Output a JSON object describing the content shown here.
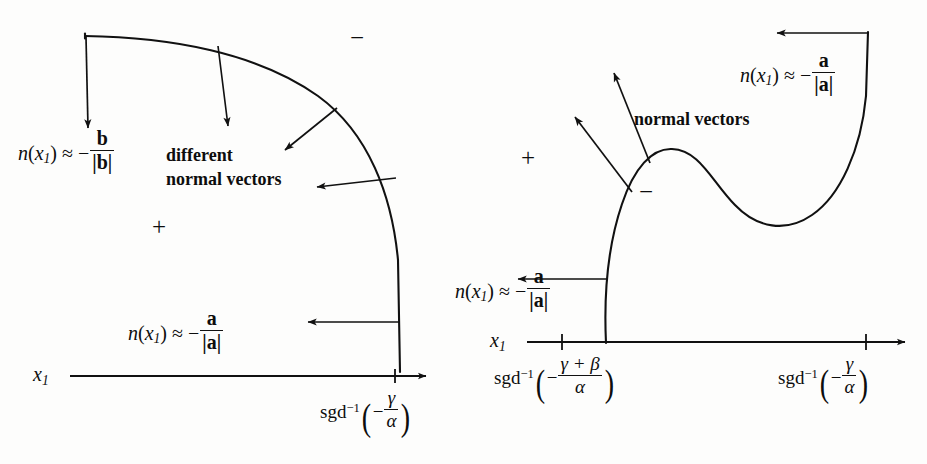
{
  "figure": {
    "background_color": "#fdfdfc",
    "ink_color": "#111111"
  },
  "left_panel": {
    "region_sign_outside": "−",
    "region_sign_inside": "+",
    "normal_label_top": {
      "n": "n",
      "arg_open": "(",
      "var": "x",
      "sub": "1",
      "arg_close": ")",
      "approx": "≈",
      "minus": "−",
      "numerator": "b",
      "denominator": "|b|"
    },
    "annotation_text_line1": "different",
    "annotation_text_line2": "normal vectors",
    "normal_label_bottom": {
      "n": "n",
      "arg_open": "(",
      "var": "x",
      "sub": "1",
      "arg_close": ")",
      "approx": "≈",
      "minus": "−",
      "numerator": "a",
      "denominator": "|a|"
    },
    "axis": {
      "label": "x",
      "label_sub": "1",
      "tick_label": {
        "func": "sgd",
        "exponent": "−1",
        "paren_open": "(",
        "minus": "−",
        "numerator": "γ",
        "denominator": "α",
        "paren_close": ")"
      }
    }
  },
  "right_panel": {
    "region_sign_outside": "+",
    "region_sign_inside": "−",
    "normal_label_topright": {
      "n": "n",
      "arg_open": "(",
      "var": "x",
      "sub": "1",
      "arg_close": ")",
      "approx": "≈",
      "minus": "−",
      "numerator": "a",
      "denominator": "|a|"
    },
    "annotation_text": "normal vectors",
    "normal_label_left": {
      "n": "n",
      "arg_open": "(",
      "var": "x",
      "sub": "1",
      "arg_close": ")",
      "approx": "≈",
      "minus": "−",
      "numerator": "a",
      "denominator": "|a|"
    },
    "axis": {
      "label": "x",
      "label_sub": "1",
      "tick_label_left": {
        "func": "sgd",
        "exponent": "−1",
        "paren_open": "(",
        "minus": "−",
        "numerator": "γ + β",
        "denominator": "α",
        "paren_close": ")"
      },
      "tick_label_right": {
        "func": "sgd",
        "exponent": "−1",
        "paren_open": "(",
        "minus": "−",
        "numerator": "γ",
        "denominator": "α",
        "paren_close": ")"
      }
    }
  }
}
